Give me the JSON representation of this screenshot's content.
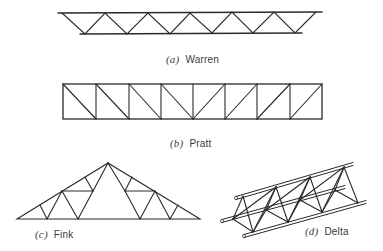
{
  "figures": [
    {
      "id": "a",
      "letter": "(a)",
      "name": "Warren"
    },
    {
      "id": "b",
      "letter": "(b)",
      "name": "Pratt"
    },
    {
      "id": "c",
      "letter": "(c)",
      "name": "Fink"
    },
    {
      "id": "d",
      "letter": "(d)",
      "name": "Delta"
    }
  ],
  "colors": {
    "line": "#2a2a2a",
    "text": "#3a3a3a",
    "background": "#ffffff"
  }
}
